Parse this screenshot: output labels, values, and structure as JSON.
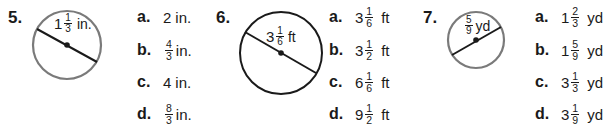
{
  "problems": [
    {
      "number": "5.",
      "figure": {
        "label_whole": "1",
        "label_num": "1",
        "label_den": "3",
        "label_unit": "in.",
        "stroke_color": "#7a7a7a"
      },
      "options": [
        {
          "letter": "a.",
          "whole": "2",
          "num": "",
          "den": "",
          "unit": "in."
        },
        {
          "letter": "b.",
          "whole": "",
          "num": "4",
          "den": "3",
          "unit": "in."
        },
        {
          "letter": "c.",
          "whole": "4",
          "num": "",
          "den": "",
          "unit": "in."
        },
        {
          "letter": "d.",
          "whole": "",
          "num": "8",
          "den": "3",
          "unit": "in."
        }
      ]
    },
    {
      "number": "6.",
      "figure": {
        "label_whole": "3",
        "label_num": "1",
        "label_den": "6",
        "label_unit": "ft",
        "stroke_color": "#1a1a1a"
      },
      "options": [
        {
          "letter": "a.",
          "whole": "3",
          "num": "1",
          "den": "6",
          "unit": "ft"
        },
        {
          "letter": "b.",
          "whole": "3",
          "num": "1",
          "den": "2",
          "unit": "ft"
        },
        {
          "letter": "c.",
          "whole": "6",
          "num": "1",
          "den": "6",
          "unit": "ft"
        },
        {
          "letter": "d.",
          "whole": "9",
          "num": "1",
          "den": "2",
          "unit": "ft"
        }
      ]
    },
    {
      "number": "7.",
      "figure": {
        "label_whole": "",
        "label_num": "5",
        "label_den": "9",
        "label_unit": "yd",
        "stroke_color": "#7a7a7a"
      },
      "options": [
        {
          "letter": "a.",
          "whole": "1",
          "num": "2",
          "den": "3",
          "unit": "yd"
        },
        {
          "letter": "b.",
          "whole": "1",
          "num": "5",
          "den": "9",
          "unit": "yd"
        },
        {
          "letter": "c.",
          "whole": "3",
          "num": "1",
          "den": "3",
          "unit": "yd"
        },
        {
          "letter": "d.",
          "whole": "3",
          "num": "1",
          "den": "9",
          "unit": "yd"
        }
      ]
    }
  ]
}
